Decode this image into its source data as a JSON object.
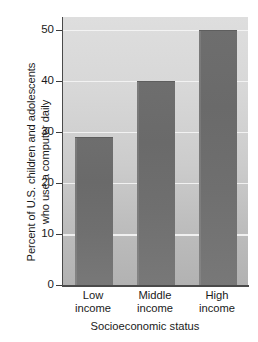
{
  "chart_data": {
    "type": "bar",
    "title": "",
    "categories": [
      "Low income",
      "Middle income",
      "High income"
    ],
    "category_lines": [
      [
        "Low",
        "income"
      ],
      [
        "Middle",
        "income"
      ],
      [
        "High",
        "income"
      ]
    ],
    "values": [
      29,
      40,
      50
    ],
    "xlabel": "Socioeconomic status",
    "ylabel": "Percent of U.S. children and adolescents who use a computer daily",
    "ylabel_lines": [
      "Percent of U.S. children and adolescents",
      "who use a computer daily"
    ],
    "ylim": [
      0,
      52.5
    ],
    "yticks": [
      0,
      10,
      20,
      30,
      40,
      50
    ],
    "ytick_labels": [
      "0",
      "10",
      "20",
      "30",
      "40",
      "50"
    ],
    "gridlines": [
      10,
      20,
      30,
      40,
      50
    ],
    "grid": true,
    "legend": "none",
    "colors": {
      "bar_fill": "#6e6e6e",
      "plot_background_top": "#dedede",
      "plot_background_bottom": "#b2b2b2",
      "gridline": "#f4f4f4",
      "axis": "#4a4a4a",
      "text": "#1a1a1a",
      "page_background": "#ffffff"
    }
  }
}
